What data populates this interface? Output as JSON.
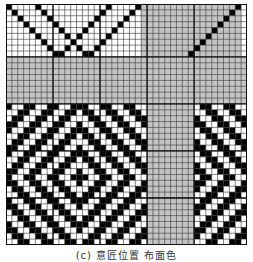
{
  "figure": {
    "caption": "(c) 意匠位置 布面色",
    "legend": {
      ".": "white-cell",
      "#": "black-cell",
      "g": "gray-cell"
    },
    "colors": {
      "white": "#ffffff",
      "black": "#000000",
      "gray": "#c4c4c4",
      "line": "#333333",
      "thick_line": "#111111"
    },
    "cols": 41,
    "rows_count": 41,
    "major_every": 8,
    "rows": [
      "#....#...........#....#gggggggggggggggg#",
      ".#....#.........#....#.ggggggggggggggg#g",
      "..#....#.......#....#..gggggggggggggg#gg",
      "...#....#.....#....#...ggggggggggggg#ggg",
      "....#....#...#....#....gggggggggggg#gggg",
      ".....#....#.#....#.....ggggggggggg#ggggg",
      "......#....#....#......gggggggggg#gggggg",
      ".......#..#.#..#.......ggggggggg#ggggggg",
      "........##...##........gggggggg#gggggggg",
      "ggggggggggggggggggggggggggggggggggggggggg",
      "ggggggggggggggggggggggggggggggggggggggggg",
      "ggggggggggggggggggggggggggggggggggggggggg",
      "ggggggggggggggggggggggggggggggggggggggggg",
      "ggggggggggggggggggggggggggggggggggggggggg",
      "ggggggggggggggggggggggggggggggggggggggggg",
      "ggggggggggggggggggggggggggggggggggggggggg",
      "ggggggggggggggggggggggggggggggggggggggggg",
      "#..##..##..###..##..##..gggggggg.##..##..",
      "..##..##..##.##..##..##.gggggggg..##..##.",
      ".##..##..##...##..##..##gggggggg#..##..##",
      "##..##..##..#..##..##..#gggggggg##..##..#",
      "#..##..##..###..##..##..gggggggg.##..##..",
      "..##..##..##.##..##..##.gggggggg..##..##.",
      ".##..##..##...##..##..##gggggggg#..##..##",
      "##..##..##..#..##..##..#gggggggg##..##..#",
      "#..##..##..###..##..##..gggggggg.##..##..",
      "..##..##..##.##..##..##.gggggggg..##..##.",
      ".##..##..##...##..##..##gggggggg#..##..##",
      "##..##..##..#..##..##..#gggggggg##..##..#",
      "#..##..##..###..##..##..gggggggg.##..##..",
      "##..##..##..#..##..##..#gggggggg##..##..#",
      ".##..##..##...##..##..##gggggggg#..##..##",
      "..##..##..##.##..##..##.gggggggg..##..##.",
      "#..##..##..###..##..##..gggggggg.##..##..",
      "##..##..##..#..##..##..#gggggggg##..##..#",
      ".##..##..##...##..##..##gggggggg#..##..##",
      "..##..##..##.##..##..##.gggggggg..##..##.",
      "#..##..##..###..##..##..gggggggg.##..##..",
      "##..##..##..#..##..##..#gggggggg##..##..#",
      ".##..##..##...##..##..##gggggggg#..##..##",
      "..##..##..##.##..##..##.gggggggg..##..##."
    ]
  }
}
